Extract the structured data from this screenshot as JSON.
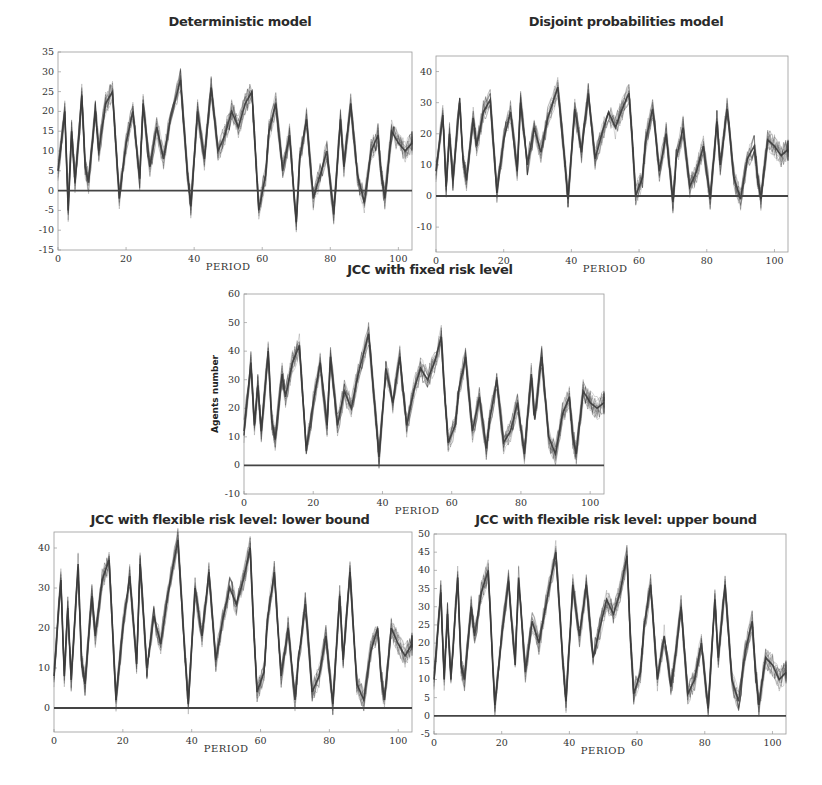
{
  "figure": {
    "background": "#ffffff",
    "line_color": "#3a3a3a",
    "zero_line_color": "#444444"
  },
  "chart_data": [
    {
      "id": "deterministic",
      "type": "line",
      "title": "Deterministic model",
      "xlabel": "Period",
      "ylabel": "",
      "xlim": [
        0,
        104
      ],
      "ylim": [
        -15,
        35
      ],
      "xticks": [
        0,
        20,
        40,
        60,
        80,
        100
      ],
      "yticks": [
        -15,
        -10,
        -5,
        0,
        5,
        10,
        15,
        20,
        25,
        30,
        35
      ],
      "reference_line": 0,
      "x": [
        0,
        2,
        3,
        4,
        5,
        7,
        8,
        9,
        11,
        12,
        14,
        16,
        18,
        20,
        22,
        24,
        25,
        27,
        29,
        31,
        33,
        36,
        38,
        39,
        41,
        43,
        45,
        47,
        49,
        51,
        53,
        55,
        57,
        58,
        59,
        61,
        62,
        64,
        66,
        68,
        70,
        71,
        73,
        75,
        77,
        79,
        81,
        83,
        84,
        86,
        88,
        90,
        92,
        94,
        95,
        96,
        98,
        100,
        102,
        104
      ],
      "values": [
        5,
        20,
        -5,
        15,
        2,
        24,
        6,
        2,
        20,
        10,
        22,
        25,
        -2,
        12,
        20,
        3,
        22,
        6,
        16,
        8,
        18,
        28,
        5,
        -4,
        20,
        8,
        26,
        10,
        14,
        20,
        16,
        22,
        25,
        10,
        -5,
        4,
        15,
        22,
        5,
        14,
        -8,
        8,
        18,
        -2,
        4,
        10,
        -6,
        18,
        6,
        22,
        4,
        -3,
        10,
        14,
        4,
        -2,
        15,
        12,
        10,
        12
      ]
    },
    {
      "id": "disjoint",
      "type": "line",
      "title": "Disjoint probabilities model",
      "xlabel": "Period",
      "ylabel": "",
      "xlim": [
        0,
        104
      ],
      "ylim": [
        -18,
        45
      ],
      "xticks": [
        0,
        20,
        40,
        60,
        80,
        100
      ],
      "yticks": [
        -10,
        0,
        10,
        20,
        30,
        40
      ],
      "reference_line": 0,
      "x": [
        0,
        2,
        3,
        4,
        5,
        7,
        8,
        9,
        11,
        12,
        14,
        16,
        18,
        20,
        22,
        24,
        25,
        27,
        29,
        31,
        33,
        36,
        38,
        39,
        41,
        43,
        45,
        47,
        49,
        51,
        53,
        55,
        57,
        58,
        59,
        61,
        62,
        64,
        66,
        68,
        70,
        71,
        73,
        75,
        77,
        79,
        81,
        83,
        84,
        86,
        88,
        90,
        92,
        94,
        95,
        96,
        98,
        100,
        102,
        104
      ],
      "values": [
        8,
        26,
        3,
        20,
        5,
        30,
        12,
        5,
        25,
        16,
        27,
        31,
        1,
        18,
        27,
        8,
        30,
        10,
        22,
        14,
        25,
        35,
        12,
        -1,
        28,
        14,
        33,
        12,
        20,
        27,
        22,
        28,
        33,
        18,
        0,
        6,
        18,
        28,
        8,
        20,
        -2,
        12,
        22,
        3,
        8,
        16,
        -1,
        24,
        10,
        28,
        6,
        -1,
        12,
        16,
        6,
        -1,
        18,
        16,
        13,
        15
      ]
    },
    {
      "id": "jcc-fixed",
      "type": "line",
      "title": "JCC with fixed risk level",
      "xlabel": "Period",
      "ylabel": "Agents number",
      "xlim": [
        0,
        104
      ],
      "ylim": [
        -10,
        60
      ],
      "xticks": [
        0,
        20,
        40,
        60,
        80,
        100
      ],
      "yticks": [
        -10,
        0,
        10,
        20,
        30,
        40,
        50,
        60
      ],
      "reference_line": 0,
      "x": [
        0,
        2,
        3,
        4,
        5,
        7,
        8,
        9,
        11,
        12,
        14,
        16,
        18,
        20,
        22,
        24,
        25,
        27,
        29,
        31,
        33,
        36,
        38,
        39,
        41,
        43,
        45,
        47,
        49,
        51,
        53,
        55,
        57,
        58,
        59,
        61,
        62,
        64,
        66,
        68,
        70,
        71,
        73,
        75,
        77,
        79,
        81,
        83,
        84,
        86,
        88,
        90,
        92,
        94,
        95,
        96,
        98,
        100,
        102,
        104
      ],
      "values": [
        12,
        36,
        14,
        28,
        12,
        40,
        16,
        9,
        32,
        24,
        36,
        42,
        5,
        22,
        36,
        14,
        38,
        14,
        26,
        20,
        32,
        46,
        18,
        3,
        34,
        22,
        38,
        14,
        26,
        34,
        30,
        36,
        45,
        24,
        8,
        14,
        26,
        38,
        12,
        24,
        6,
        16,
        30,
        8,
        12,
        22,
        4,
        32,
        16,
        38,
        10,
        4,
        18,
        24,
        10,
        4,
        26,
        22,
        20,
        22
      ]
    },
    {
      "id": "jcc-flexible-lower",
      "type": "line",
      "title": "JCC with flexible risk level: lower bound",
      "xlabel": "Period",
      "ylabel": "",
      "xlim": [
        0,
        104
      ],
      "ylim": [
        -6,
        44
      ],
      "xticks": [
        0,
        20,
        40,
        60,
        80,
        100
      ],
      "yticks": [
        0,
        10,
        20,
        30,
        40
      ],
      "reference_line": 0,
      "x": [
        0,
        2,
        3,
        4,
        5,
        7,
        8,
        9,
        11,
        12,
        14,
        16,
        18,
        20,
        22,
        24,
        25,
        27,
        29,
        31,
        33,
        36,
        38,
        39,
        41,
        43,
        45,
        47,
        49,
        51,
        53,
        55,
        57,
        58,
        59,
        61,
        62,
        64,
        66,
        68,
        70,
        71,
        73,
        75,
        77,
        79,
        81,
        83,
        84,
        86,
        88,
        90,
        92,
        94,
        95,
        96,
        98,
        100,
        102,
        104
      ],
      "values": [
        8,
        32,
        8,
        25,
        7,
        36,
        12,
        6,
        28,
        18,
        32,
        37,
        2,
        20,
        33,
        11,
        36,
        10,
        23,
        16,
        28,
        42,
        14,
        1,
        30,
        18,
        34,
        12,
        22,
        30,
        26,
        32,
        40,
        20,
        4,
        9,
        22,
        34,
        8,
        20,
        2,
        12,
        26,
        4,
        8,
        18,
        1,
        28,
        12,
        34,
        6,
        2,
        14,
        20,
        8,
        2,
        20,
        16,
        13,
        16
      ]
    },
    {
      "id": "jcc-flexible-upper",
      "type": "line",
      "title": "JCC with flexible risk level: upper bound",
      "xlabel": "Period",
      "ylabel": "",
      "xlim": [
        0,
        104
      ],
      "ylim": [
        -5,
        50
      ],
      "xticks": [
        0,
        20,
        40,
        60,
        80,
        100
      ],
      "yticks": [
        -5,
        0,
        5,
        10,
        15,
        20,
        25,
        30,
        35,
        40,
        45,
        50
      ],
      "reference_line": 0,
      "x": [
        0,
        2,
        3,
        4,
        5,
        7,
        8,
        9,
        11,
        12,
        14,
        16,
        18,
        20,
        22,
        24,
        25,
        27,
        29,
        31,
        33,
        36,
        38,
        39,
        41,
        43,
        45,
        47,
        49,
        51,
        53,
        55,
        57,
        58,
        59,
        61,
        62,
        64,
        66,
        68,
        70,
        71,
        73,
        75,
        77,
        79,
        81,
        83,
        84,
        86,
        88,
        90,
        92,
        94,
        95,
        96,
        98,
        100,
        102,
        104
      ],
      "values": [
        10,
        34,
        10,
        28,
        10,
        38,
        14,
        10,
        30,
        22,
        34,
        40,
        3,
        22,
        37,
        14,
        38,
        12,
        26,
        20,
        30,
        45,
        16,
        4,
        36,
        22,
        36,
        16,
        24,
        32,
        28,
        34,
        44,
        22,
        6,
        12,
        24,
        36,
        10,
        22,
        8,
        14,
        30,
        6,
        10,
        20,
        2,
        32,
        16,
        36,
        10,
        4,
        18,
        26,
        12,
        3,
        16,
        14,
        10,
        12
      ]
    }
  ]
}
